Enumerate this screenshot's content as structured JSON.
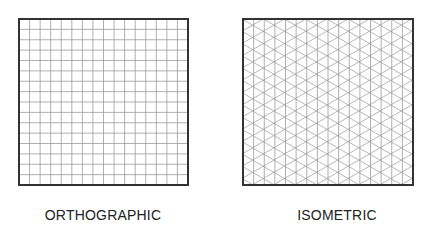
{
  "diagram": {
    "panels": [
      {
        "id": "orthographic",
        "label": "ORTHOGRAPHIC",
        "grid_type": "square",
        "columns": 16,
        "rows": 16
      },
      {
        "id": "isometric",
        "label": "ISOMETRIC",
        "grid_type": "triangular-60deg",
        "columns": 16
      }
    ],
    "colors": {
      "border": "#333333",
      "grid_line": "#9a9a9a",
      "background": "#ffffff",
      "text": "#222222"
    }
  }
}
